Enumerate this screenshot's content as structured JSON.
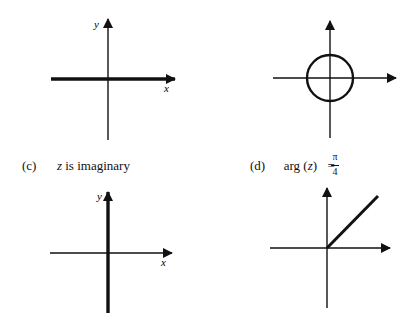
{
  "panels": [
    {
      "id": "a",
      "caption_label": "",
      "caption_text": "",
      "axis_labels": {
        "x": "x",
        "y": "y"
      },
      "highlight": "real axis (thick horizontal line)"
    },
    {
      "id": "b",
      "caption_label": "",
      "caption_text": "",
      "axis_labels": {
        "x": "",
        "y": ""
      },
      "highlight": "circle centered at origin"
    },
    {
      "id": "c",
      "caption_label": "(c)",
      "caption_text_var": "z",
      "caption_text": " is imaginary",
      "axis_labels": {
        "x": "x",
        "y": "y"
      },
      "highlight": "imaginary axis (thick vertical line)"
    },
    {
      "id": "d",
      "caption_label": "(d)",
      "caption_text": "arg (",
      "caption_var": "z",
      "caption_close": ")",
      "caption_eq": "=",
      "frac_num": "π",
      "frac_den": "4",
      "axis_labels": {
        "x": "",
        "y": ""
      },
      "highlight": "ray from origin at 45°"
    }
  ]
}
